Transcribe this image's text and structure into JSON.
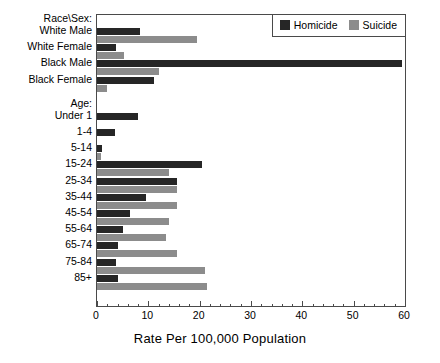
{
  "chart_data": {
    "type": "bar",
    "orientation": "horizontal",
    "title": "",
    "xlabel": "Rate Per 100,000 Population",
    "ylabel": "",
    "xlim": [
      0,
      60
    ],
    "xticks": [
      0,
      10,
      20,
      30,
      40,
      50,
      60
    ],
    "xtick_labels": [
      "0",
      "10",
      "20",
      "30",
      "40",
      "50",
      "60"
    ],
    "minor_tick_interval": 2,
    "grid": false,
    "legend_position": "top-right",
    "legend": [
      "Homicide",
      "Suicide"
    ],
    "series": [
      {
        "name": "Homicide",
        "color": "#262626",
        "values": [
          8.4,
          3.7,
          59.5,
          11.1,
          8.0,
          3.5,
          1.0,
          20.5,
          15.5,
          9.5,
          6.5,
          5.0,
          4.0,
          3.7,
          4.0
        ]
      },
      {
        "name": "Suicide",
        "color": "#8c8c8c",
        "values": [
          19.5,
          5.3,
          12.1,
          2.0,
          0.0,
          0.0,
          0.8,
          14.0,
          15.5,
          15.5,
          14.0,
          13.5,
          15.5,
          21.0,
          21.5
        ]
      }
    ],
    "group_headings": [
      {
        "label": "Race\\Sex:",
        "index": 0
      },
      {
        "label": "Age:",
        "index": 4
      }
    ],
    "categories": [
      "White Male",
      "White Female",
      "Black Male",
      "Black Female",
      "Under 1",
      "1-4",
      "5-14",
      "15-24",
      "25-34",
      "35-44",
      "45-54",
      "55-64",
      "65-74",
      "75-84",
      "85+"
    ]
  },
  "legend": {
    "homicide_label": "Homicide",
    "suicide_label": "Suicide"
  },
  "axis": {
    "title": "Rate Per 100,000 Population"
  },
  "headings": {
    "race_sex": "Race\\Sex:",
    "age": "Age:"
  },
  "colors": {
    "homicide": "#262626",
    "suicide": "#8c8c8c",
    "frame": "#4a4a4a",
    "background": "#ffffff"
  }
}
